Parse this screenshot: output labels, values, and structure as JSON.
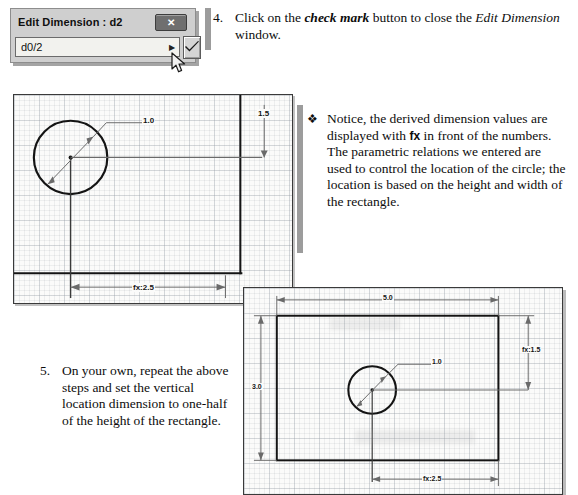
{
  "dialog": {
    "title": "Edit Dimension : d2",
    "input_value": "d0/2",
    "input_placeholder": "",
    "close_label": "✕",
    "dropdown_icon": "dropdown-arrow-icon",
    "check_icon": "check-mark-icon",
    "cursor_icon": "mouse-cursor-icon"
  },
  "steps": [
    {
      "number": "4.",
      "text_parts": {
        "p1": "Click on the ",
        "emph1": "check mark",
        "p2": " button to close the ",
        "ital1": "Edit Dimension",
        "p3": " window."
      }
    },
    {
      "number": "5.",
      "text": "On your own, repeat the above steps and set the vertical location dimension to one-half of the height of the rectangle."
    }
  ],
  "bullet": {
    "marker": "❖",
    "text_parts": {
      "p1": "Notice, the derived dimension values are displayed with ",
      "fx": "fx",
      "p2": " in front of the numbers. The parametric relations we entered are used to control the location of the circle; the location is based on the height and width of the rectangle."
    }
  },
  "cad_panel_top_left": {
    "name": "sketch-view-upper",
    "dimensions": {
      "circle_diameter": "1.0",
      "vertical_location": "1.5",
      "horizontal_location": "fx:2.5"
    }
  },
  "cad_panel_bottom_right": {
    "name": "sketch-view-lower",
    "dimensions": {
      "width": "5.0",
      "height": "3.0",
      "circle_diameter": "1.0",
      "vertical_location": "fx:1.5",
      "horizontal_location": "fx:2.5"
    }
  },
  "colors": {
    "ink": "#0d0d0d",
    "geometry": "#111111",
    "dimension": "#555555",
    "grid": "#969ea8",
    "dialog_face": "#cfcfcf"
  }
}
